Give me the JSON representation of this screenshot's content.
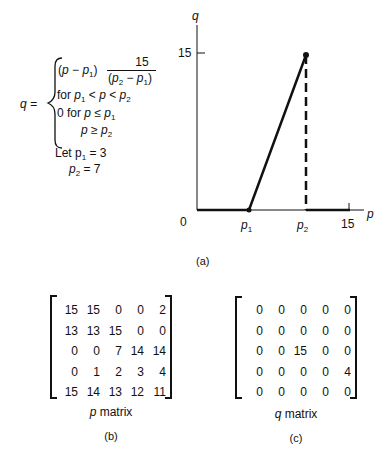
{
  "formula": {
    "lhs": "q =",
    "case1_expr": "(p − p1)",
    "fraction_num": "15",
    "fraction_den": "(p2 − p1)",
    "case1_cond": "for p1 < p < p2",
    "case2": "0 for p ≤ p1",
    "case2b": "p ≥ p2",
    "let1": "Let p1 = 3",
    "let2": "p2 = 7"
  },
  "graph": {
    "y_axis_label": "q",
    "x_axis_label": "p",
    "y_tick": "15",
    "origin": "0",
    "x_ticks": [
      "p1",
      "p2",
      "15"
    ],
    "caption": "(a)"
  },
  "chart_data": {
    "type": "line",
    "title": "",
    "xlabel": "p",
    "ylabel": "q",
    "x": [
      0,
      3,
      7,
      7,
      15
    ],
    "y": [
      0,
      0,
      15,
      0,
      0
    ],
    "xlim": [
      0,
      15
    ],
    "ylim": [
      0,
      15
    ],
    "annotations": [
      "p1 = 3",
      "p2 = 7",
      "dashed vertical drop at p2"
    ],
    "grid": false
  },
  "p_matrix": {
    "label": "p matrix",
    "caption": "(b)",
    "rows": [
      [
        "15",
        "15",
        "0",
        "0",
        "2"
      ],
      [
        "13",
        "13",
        "15",
        "0",
        "0"
      ],
      [
        "0",
        "0",
        "7",
        "14",
        "14"
      ],
      [
        "0",
        "1",
        "2",
        "3",
        "4"
      ],
      [
        "15",
        "14",
        "13",
        "12",
        "11"
      ]
    ]
  },
  "q_matrix": {
    "label": "q matrix",
    "caption": "(c)",
    "rows": [
      [
        "0",
        "0",
        "0",
        "0",
        "0"
      ],
      [
        "0",
        "0",
        "0",
        "0",
        "0"
      ],
      [
        "0",
        "0",
        "15",
        "0",
        "0"
      ],
      [
        "0",
        "0",
        "0",
        "0",
        "4"
      ],
      [
        "0",
        "0",
        "0",
        "0",
        "0"
      ]
    ]
  }
}
